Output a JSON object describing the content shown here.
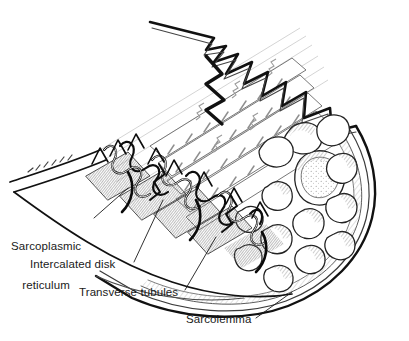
{
  "figure": {
    "kind": "anatomical-line-illustration",
    "background_color": "#ffffff",
    "ink_color": "#1a1a1a",
    "shading_color": "#6f6f6f"
  },
  "labels": {
    "sarcoplasmic_reticulum": {
      "line1": "Sarcoplasmic",
      "line2": "reticulum"
    },
    "intercalated_disk": "Intercalated disk",
    "transverse_tubules": "Transverse tubules",
    "sarcolemma": "Sarcolemma"
  }
}
